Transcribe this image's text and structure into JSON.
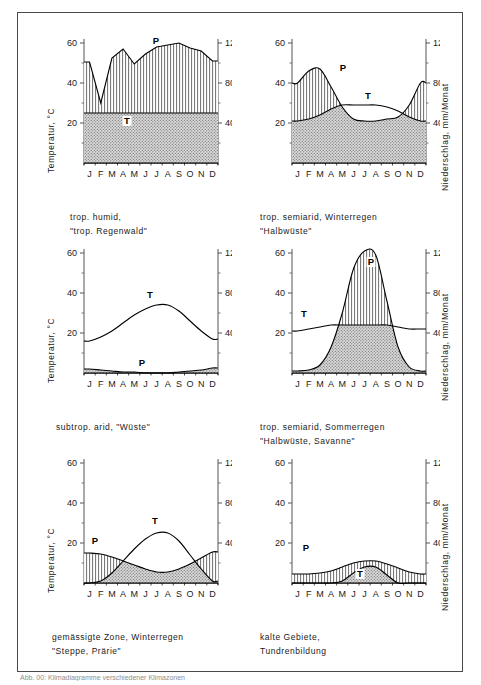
{
  "figure": {
    "caption": "Abb. 00: Klimadiagramme verschiedener Klimazonen",
    "axis_left_label": "Temperatur, °C",
    "axis_right_label": "Niederschlag, mm/Monat",
    "months": [
      "J",
      "F",
      "M",
      "A",
      "M",
      "J",
      "J",
      "A",
      "S",
      "O",
      "N",
      "D"
    ],
    "left_ticks": [
      "60",
      "40",
      "20"
    ],
    "right_ticks": [
      "120",
      "80",
      "40"
    ],
    "series_label_temp": "T",
    "series_label_precip": "P",
    "colors": {
      "line": "#000000",
      "axis": "#555555",
      "frame": "#4a4a4a",
      "humid_fill": "#e8e8e8",
      "arid_fill": "#b0b0b0",
      "text": "#1a1a1a"
    }
  },
  "chart_data": [
    {
      "type": "area",
      "id": "panel-1",
      "title": "trop. humid, \"trop. Regenwald\"",
      "caption_line1": "trop. humid,",
      "caption_line2": "\"trop. Regenwald\"",
      "xlabel": "",
      "ylabel": "Temperatur, °C",
      "ylabel_right": "Niederschlag, mm/Monat",
      "categories": [
        "J",
        "F",
        "M",
        "A",
        "M",
        "J",
        "J",
        "A",
        "S",
        "O",
        "N",
        "D"
      ],
      "temp_ylim": [
        0,
        60
      ],
      "precip_ylim": [
        0,
        120
      ],
      "ytick_left": [
        60,
        40,
        20
      ],
      "ytick_right": [
        120,
        80,
        40
      ],
      "series": [
        {
          "name": "Temperatur",
          "unit": "°C",
          "label": "T",
          "values": [
            25,
            25,
            25,
            25,
            25,
            25,
            25,
            25,
            25,
            25,
            25,
            25
          ]
        },
        {
          "name": "Niederschlag",
          "unit": "mm/Monat",
          "label": "P",
          "values": [
            101,
            60,
            105,
            114,
            99,
            109,
            116,
            118,
            120,
            115,
            112,
            102
          ]
        }
      ],
      "humid_months": 12,
      "arid_months": 0,
      "note": "Niederschlag liegt ganzjährig über der Temperaturkurve (humid)"
    },
    {
      "type": "area",
      "id": "panel-2",
      "title": "trop. semiarid, Winterregen \"Halbwüste\"",
      "caption_line1": "trop. semiarid, Winterregen",
      "caption_line2": "\"Halbwüste\"",
      "xlabel": "",
      "ylabel": "",
      "ylabel_right": "Niederschlag, mm/Monat",
      "categories": [
        "J",
        "F",
        "M",
        "A",
        "M",
        "J",
        "J",
        "A",
        "S",
        "O",
        "N",
        "D"
      ],
      "temp_ylim": [
        0,
        60
      ],
      "precip_ylim": [
        0,
        120
      ],
      "ytick_left": [
        60,
        40,
        20
      ],
      "ytick_right": [
        120,
        80,
        40
      ],
      "series": [
        {
          "name": "Temperatur",
          "unit": "°C",
          "label": "T",
          "values": [
            21,
            22,
            24,
            27,
            29,
            29,
            29,
            29,
            28,
            26,
            23,
            21
          ]
        },
        {
          "name": "Niederschlag",
          "unit": "mm/Monat",
          "label": "P",
          "values": [
            80,
            92,
            94,
            76,
            56,
            44,
            42,
            42,
            44,
            46,
            58,
            80
          ]
        }
      ],
      "humid_months": 5,
      "arid_months": 7,
      "note": "Winterregen: humid Nov–April, arid Mai–Oktober"
    },
    {
      "type": "area",
      "id": "panel-3",
      "title": "subtrop. arid, \"Wüste\"",
      "caption_line1": "subtrop. arid, \"Wüste\"",
      "caption_line2": "",
      "xlabel": "",
      "ylabel": "Temperatur, °C",
      "ylabel_right": "",
      "categories": [
        "J",
        "F",
        "M",
        "A",
        "M",
        "J",
        "J",
        "A",
        "S",
        "O",
        "N",
        "D"
      ],
      "temp_ylim": [
        0,
        60
      ],
      "precip_ylim": [
        0,
        120
      ],
      "ytick_left": [
        60,
        40,
        20
      ],
      "ytick_right": [
        120,
        80,
        40
      ],
      "series": [
        {
          "name": "Temperatur",
          "unit": "°C",
          "label": "T",
          "values": [
            16,
            18,
            21,
            25,
            29,
            32,
            34,
            34,
            31,
            26,
            21,
            17
          ]
        },
        {
          "name": "Niederschlag",
          "unit": "mm/Monat",
          "label": "P",
          "values": [
            4,
            3,
            2,
            1,
            1,
            0,
            0,
            0,
            1,
            2,
            3,
            5
          ]
        }
      ],
      "humid_months": 0,
      "arid_months": 12,
      "note": "Ganzjährig arid, Niederschlag nahe Null"
    },
    {
      "type": "area",
      "id": "panel-4",
      "title": "trop. semiarid, Sommerregen \"Halbwüste, Savanne\"",
      "caption_line1": "trop. semiarid, Sommerregen",
      "caption_line2": "\"Halbwüste, Savanne\"",
      "xlabel": "",
      "ylabel": "",
      "ylabel_right": "Niederschlag, mm/Monat",
      "categories": [
        "J",
        "F",
        "M",
        "A",
        "M",
        "J",
        "J",
        "A",
        "S",
        "O",
        "N",
        "D"
      ],
      "temp_ylim": [
        0,
        60
      ],
      "precip_ylim": [
        0,
        120
      ],
      "ytick_left": [
        60,
        40,
        20
      ],
      "ytick_right": [
        120,
        80,
        40
      ],
      "series": [
        {
          "name": "Temperatur",
          "unit": "°C",
          "label": "T",
          "values": [
            21,
            22,
            23,
            24,
            24,
            24,
            24,
            24,
            24,
            23,
            22,
            22
          ]
        },
        {
          "name": "Niederschlag",
          "unit": "mm/Monat",
          "label": "P",
          "values": [
            2,
            3,
            8,
            26,
            60,
            104,
            122,
            118,
            72,
            26,
            6,
            2
          ]
        }
      ],
      "humid_months": 5,
      "arid_months": 7,
      "note": "Sommerregen: humid Mai–September, arid Oktober–April"
    },
    {
      "type": "area",
      "id": "panel-5",
      "title": "gemässigte Zone, Winterregen \"Steppe, Prärie\"",
      "caption_line1": "gemässigte Zone, Winterregen",
      "caption_line2": "\"Steppe, Prärie\"",
      "xlabel": "",
      "ylabel": "Temperatur, °C",
      "ylabel_right": "",
      "categories": [
        "J",
        "F",
        "M",
        "A",
        "M",
        "J",
        "J",
        "A",
        "S",
        "O",
        "N",
        "D"
      ],
      "temp_ylim": [
        0,
        60
      ],
      "precip_ylim": [
        0,
        120
      ],
      "ytick_left": [
        60,
        40,
        20
      ],
      "ytick_right": [
        120,
        80,
        40
      ],
      "series": [
        {
          "name": "Temperatur",
          "unit": "°C",
          "label": "T",
          "values": [
            0,
            1,
            5,
            11,
            17,
            22,
            25,
            25,
            21,
            14,
            7,
            1
          ]
        },
        {
          "name": "Niederschlag",
          "unit": "mm/Monat",
          "label": "P",
          "values": [
            30,
            29,
            26,
            22,
            18,
            14,
            11,
            11,
            14,
            19,
            25,
            31
          ]
        }
      ],
      "humid_months": 5,
      "arid_months": 7,
      "note": "Winterregen: humid Nov–März, arid April–Oktober"
    },
    {
      "type": "area",
      "id": "panel-6",
      "title": "kalte Gebiete, Tundrenbildung",
      "caption_line1": "kalte Gebiete,",
      "caption_line2": "Tundrenbildung",
      "xlabel": "",
      "ylabel": "",
      "ylabel_right": "Niederschlag, mm/Monat",
      "categories": [
        "J",
        "F",
        "M",
        "A",
        "M",
        "J",
        "J",
        "A",
        "S",
        "O",
        "N",
        "D"
      ],
      "temp_ylim": [
        0,
        60
      ],
      "precip_ylim": [
        0,
        120
      ],
      "ytick_left": [
        60,
        40,
        20
      ],
      "ytick_right": [
        120,
        80,
        40
      ],
      "series": [
        {
          "name": "Temperatur",
          "unit": "°C",
          "label": "T",
          "values": [
            0,
            0,
            0,
            0,
            1,
            5,
            8,
            8,
            4,
            0,
            0,
            0
          ]
        },
        {
          "name": "Niederschlag",
          "unit": "mm/Monat",
          "label": "P",
          "values": [
            9,
            9,
            10,
            12,
            16,
            20,
            22,
            22,
            19,
            15,
            11,
            9
          ]
        }
      ],
      "humid_months": 12,
      "arid_months": 0,
      "note": "Ganzjährig humid, geringe Beträge"
    }
  ]
}
